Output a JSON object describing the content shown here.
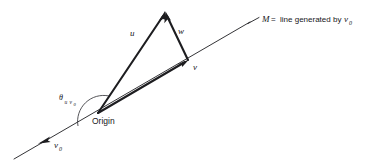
{
  "figure": {
    "background_color": "#ffffff",
    "ink_color": "#1d1d20",
    "labels": {
      "origin": "Origin",
      "vector_u": "u",
      "vector_w": "w",
      "vector_v": "v",
      "vector_v0_base": "v",
      "vector_v0_sub": "0",
      "theta_symbol": "θ",
      "theta_sub_first": "u",
      "theta_sub_second": "v",
      "theta_sub_second_sub": "0",
      "line_name": "M",
      "equals": "=",
      "caption_text": "line generated by",
      "caption_vector_base": "v",
      "caption_vector_sub": "0"
    },
    "geometry": {
      "origin_point": [
        98,
        113
      ],
      "apex_point": [
        165,
        12
      ],
      "v_tip_point": [
        188,
        60
      ],
      "line_m_start": [
        14,
        159
      ],
      "line_m_end": [
        250,
        22
      ],
      "v0_arrow_tip": [
        42,
        141
      ],
      "leader_start": [
        248,
        23
      ],
      "leader_end": [
        258,
        18
      ]
    }
  }
}
